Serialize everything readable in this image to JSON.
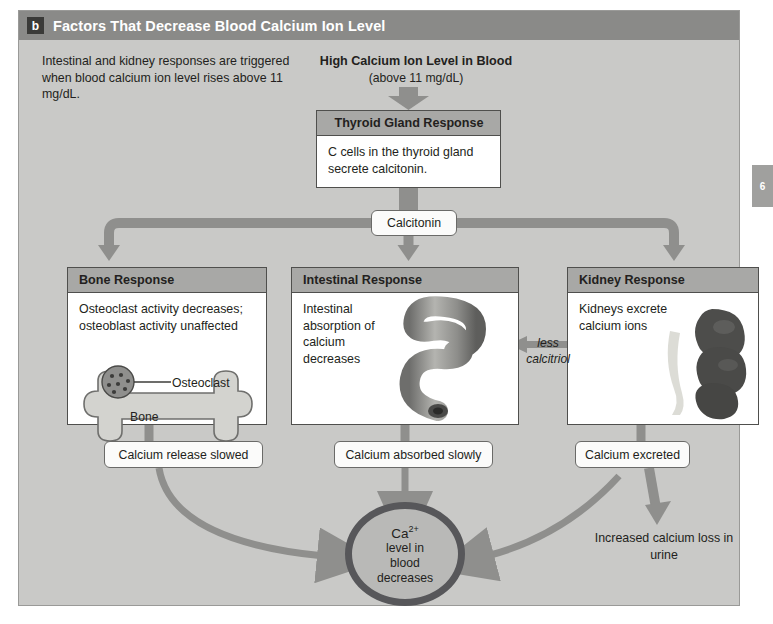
{
  "figure": {
    "badge": "b",
    "title": "Factors That Decrease Blood Calcium Ion Level",
    "intro": "Intestinal and kidney responses are triggered when blood calcium ion level rises above 11 mg/dL.",
    "page_marker": "6"
  },
  "stimulus": {
    "title": "High Calcium Ion Level in Blood",
    "subtitle": "(above 11 mg/dL)"
  },
  "thyroid": {
    "header": "Thyroid Gland Response",
    "body": "C cells in the thyroid gland secrete calcitonin."
  },
  "hormone": {
    "label": "Calcitonin"
  },
  "responses": [
    {
      "header": "Bone Response",
      "body": "Osteoclast activity decreases; osteoblast activity unaffected",
      "illustration_labels": {
        "cell": "Osteoclast",
        "tissue": "Bone"
      },
      "outcome": "Calcium release slowed"
    },
    {
      "header": "Intestinal Response",
      "body": "Intestinal absorption of calcium decreases",
      "outcome": "Calcium absorbed slowly"
    },
    {
      "header": "Kidney Response",
      "body": "Kidneys excrete calcium ions",
      "outcome": "Calcium excreted"
    }
  ],
  "feedback": {
    "line1": "less",
    "line2": "calcitriol"
  },
  "result": {
    "ion": "Ca",
    "ion_charge": "2+",
    "line1": "level in",
    "line2": "blood",
    "line3": "decreases"
  },
  "urine": {
    "text": "Increased calcium loss in urine"
  },
  "colors": {
    "figure_background": "#c9c9c7",
    "header_bar": "#8a8a88",
    "box_header": "#a8a8a6",
    "arrow": "#8f8f8d",
    "oval_ring": "#57575a"
  }
}
